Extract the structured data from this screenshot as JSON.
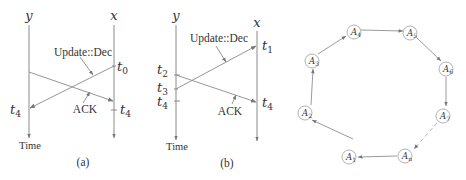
{
  "panels": {
    "a": {
      "caption": "(a)",
      "axes": {
        "left": "y",
        "right": "x"
      },
      "time_label": "Time",
      "message_label": "Update::Dec",
      "ack_label": "ACK",
      "t_right_top": "t",
      "t_right_top_sub": "0",
      "t_left": "t",
      "t_left_sub": "4",
      "t_right_bottom": "t",
      "t_right_bottom_sub": "4"
    },
    "b": {
      "caption": "(b)",
      "axes": {
        "left": "y",
        "right": "x"
      },
      "time_label": "Time",
      "message_label": "Update::Dec",
      "ack_label": "ACK",
      "t_right_top": "t",
      "t_right_top_sub": "1",
      "t_left_1": "t",
      "t_left_1_sub": "2",
      "t_left_2": "t",
      "t_left_2_sub": "3",
      "t_left_3": "t",
      "t_left_3_sub": "4",
      "t_right_bottom": "t",
      "t_right_bottom_sub": "4"
    },
    "ring": {
      "nodes": [
        {
          "label": "A",
          "sub": "1"
        },
        {
          "label": "A",
          "sub": "2"
        },
        {
          "label": "A",
          "sub": "3"
        },
        {
          "label": "A",
          "sub": "4"
        },
        {
          "label": "A",
          "sub": "5"
        },
        {
          "label": "A",
          "sub": "6"
        },
        {
          "label": "A",
          "sub": "7"
        },
        {
          "label": "A",
          "sub": "n"
        }
      ],
      "edges": [
        "A1->A2",
        "A2->A3",
        "A3->A4",
        "A4->A5",
        "A5->A6",
        "A6->A7",
        "A7->An (dashed)",
        "An->A1"
      ]
    }
  }
}
